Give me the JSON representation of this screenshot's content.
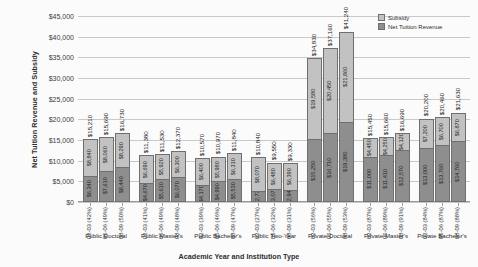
{
  "chart_data": {
    "type": "bar",
    "subtype": "stacked-bar-grouped",
    "title": "",
    "xlabel": "Academic Year and Institution Type",
    "ylabel": "Net Tuition Revenue and Subsidy",
    "ylim": [
      0,
      45000
    ],
    "ytick_labels": [
      "$45,000",
      "$40,000",
      "$35,000",
      "$30,000",
      "$25,000",
      "$20,000",
      "$15,000",
      "$10,000",
      "$5,000",
      "$0"
    ],
    "ytick_values": [
      45000,
      40000,
      35000,
      30000,
      25000,
      20000,
      15000,
      10000,
      5000,
      0
    ],
    "grid": true,
    "legend_position": "top-right",
    "series": [
      {
        "name": "Subsidy",
        "color": "#c2c2c2"
      },
      {
        "name": "Net Tuition Revenue",
        "color": "#8e8e8e"
      }
    ],
    "groups": [
      {
        "category": "Public Doctoral",
        "bars": [
          {
            "year": "02-03",
            "pct": "(42%)",
            "tick": "02-03 (42%)",
            "net_tuition": 6340,
            "net_tuition_label": "$6,340",
            "subsidy": 8840,
            "subsidy_label": "$8,840",
            "total": 15210,
            "total_label": "$15,210"
          },
          {
            "year": "05-06",
            "pct": "(49%)",
            "tick": "05-06 (49%)",
            "net_tuition": 7610,
            "net_tuition_label": "$7,610",
            "subsidy": 8060,
            "subsidy_label": "$8,060",
            "total": 15690,
            "total_label": "$15,690"
          },
          {
            "year": "08-09",
            "pct": "(50%)",
            "tick": "08-09 (50%)",
            "net_tuition": 8440,
            "net_tuition_label": "$8,440",
            "subsidy": 8290,
            "subsidy_label": "$8,290",
            "total": 16730,
            "total_label": "$16,730"
          }
        ]
      },
      {
        "category": "Public Master's",
        "bars": [
          {
            "year": "02-03",
            "pct": "(41%)",
            "tick": "02-03 (41%)",
            "net_tuition": 4670,
            "net_tuition_label": "$4,670",
            "subsidy": 6690,
            "subsidy_label": "$6,690",
            "total": 11380,
            "total_label": "$11,380"
          },
          {
            "year": "05-06",
            "pct": "(49%)",
            "tick": "05-06 (49%)",
            "net_tuition": 5610,
            "net_tuition_label": "$5,610",
            "subsidy": 5920,
            "subsidy_label": "$5,920",
            "total": 11530,
            "total_label": "$11,530"
          },
          {
            "year": "08-09",
            "pct": "(48%)",
            "tick": "08-09 (48%)",
            "net_tuition": 6070,
            "net_tuition_label": "$6,070",
            "subsidy": 6300,
            "subsidy_label": "$6,300",
            "total": 12370,
            "total_label": "$12,370"
          }
        ]
      },
      {
        "category": "Public Bachelor's",
        "bars": [
          {
            "year": "02-03",
            "pct": "(39%)",
            "tick": "02-03 (39%)",
            "net_tuition": 4170,
            "net_tuition_label": "$4,170",
            "subsidy": 6400,
            "subsidy_label": "$6,400",
            "total": 10570,
            "total_label": "$10,570"
          },
          {
            "year": "05-06",
            "pct": "(46%)",
            "tick": "05-06 (46%)",
            "net_tuition": 4990,
            "net_tuition_label": "$4,990",
            "subsidy": 5980,
            "subsidy_label": "$5,980",
            "total": 10970,
            "total_label": "$10,970"
          },
          {
            "year": "08-09",
            "pct": "(47%)",
            "tick": "08-09 (47%)",
            "net_tuition": 5530,
            "net_tuition_label": "$5,530",
            "subsidy": 6310,
            "subsidy_label": "$6,310",
            "total": 11840,
            "total_label": "$11,840"
          }
        ]
      },
      {
        "category": "Public Two-Year",
        "bars": [
          {
            "year": "02-03",
            "pct": "(27%)",
            "tick": "02-03 (27%)",
            "net_tuition": 2770,
            "net_tuition_label": "$2,770",
            "subsidy": 8070,
            "subsidy_label": "$8,070",
            "total": 10840,
            "total_label": "$10,840"
          },
          {
            "year": "05-06",
            "pct": "(32%)",
            "tick": "05-06 (32%)",
            "net_tuition": 3070,
            "net_tuition_label": "$3,070",
            "subsidy": 6480,
            "subsidy_label": "$6,480",
            "total": 9550,
            "total_label": "$9,550"
          },
          {
            "year": "08-09",
            "pct": "(31%)",
            "tick": "08-09 (31%)",
            "net_tuition": 2940,
            "net_tuition_label": "$2,940",
            "subsidy": 6390,
            "subsidy_label": "$6,390",
            "total": 9330,
            "total_label": "$9,330"
          }
        ]
      },
      {
        "category": "Private Doctoral",
        "bars": [
          {
            "year": "02-03",
            "pct": "(56%)",
            "tick": "02-03 (56%)",
            "net_tuition": 15250,
            "net_tuition_label": "$15,250",
            "subsidy": 19580,
            "subsidy_label": "$19,580",
            "total": 34830,
            "total_label": "$34,830"
          },
          {
            "year": "05-06",
            "pct": "(55%)",
            "tick": "05-06 (55%)",
            "net_tuition": 16710,
            "net_tuition_label": "$16,710",
            "subsidy": 20450,
            "subsidy_label": "$20,450",
            "total": 37160,
            "total_label": "$37,160"
          },
          {
            "year": "08-09",
            "pct": "(53%)",
            "tick": "08-09 (53%)",
            "net_tuition": 19380,
            "net_tuition_label": "$19,380",
            "subsidy": 21860,
            "subsidy_label": "$21,860",
            "total": 41240,
            "total_label": "$41,240"
          }
        ]
      },
      {
        "category": "Private Master's",
        "bars": [
          {
            "year": "02-03",
            "pct": "(87%)",
            "tick": "02-03 (87%)",
            "net_tuition": 11000,
            "net_tuition_label": "$11,000",
            "subsidy": 4450,
            "subsidy_label": "$4,450",
            "total": 15450,
            "total_label": "$15,450"
          },
          {
            "year": "05-06",
            "pct": "(89%)",
            "tick": "05-06 (89%)",
            "net_tuition": 11410,
            "net_tuition_label": "$11,410",
            "subsidy": 4250,
            "subsidy_label": "$4,250",
            "total": 15660,
            "total_label": "$15,660"
          },
          {
            "year": "08-09",
            "pct": "(91%)",
            "tick": "08-09 (91%)",
            "net_tuition": 12570,
            "net_tuition_label": "$12,570",
            "subsidy": 4120,
            "subsidy_label": "$4,120",
            "total": 16690,
            "total_label": "$16,690"
          }
        ]
      },
      {
        "category": "Private Bachelor's",
        "bars": [
          {
            "year": "02-03",
            "pct": "(84%)",
            "tick": "02-03 (84%)",
            "net_tuition": 13000,
            "net_tuition_label": "$13,000",
            "subsidy": 7200,
            "subsidy_label": "$7,200",
            "total": 20200,
            "total_label": "$20,200"
          },
          {
            "year": "05-06",
            "pct": "(87%)",
            "tick": "05-06 (87%)",
            "net_tuition": 13760,
            "net_tuition_label": "$13,760",
            "subsidy": 6700,
            "subsidy_label": "$6,700",
            "total": 20460,
            "total_label": "$20,460"
          },
          {
            "year": "08-09",
            "pct": "(88%)",
            "tick": "08-09 (88%)",
            "net_tuition": 14760,
            "net_tuition_label": "$14,760",
            "subsidy": 6870,
            "subsidy_label": "$6,870",
            "total": 21630,
            "total_label": "$21,630"
          }
        ]
      }
    ]
  }
}
